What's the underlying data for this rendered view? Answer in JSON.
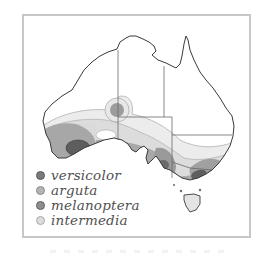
{
  "figure": {
    "type": "species distribution map",
    "region": "Australia"
  },
  "legend": {
    "items": [
      {
        "label": "versicolor",
        "color": "#7a7a7a"
      },
      {
        "label": "arguta",
        "color": "#b4b4b4"
      },
      {
        "label": "melanoptera",
        "color": "#8e8e8e"
      },
      {
        "label": "intermedia",
        "color": "#dcdcdc"
      }
    ]
  },
  "colors": {
    "frame_border": "#c8c8c8",
    "coastline": "#3a3a3a",
    "state_border": "#6a6a6a",
    "versicolor": "#5e5e5e",
    "arguta": "#d8d8d8",
    "melanoptera": "#a8a8a8",
    "intermedia": "#ececec"
  }
}
